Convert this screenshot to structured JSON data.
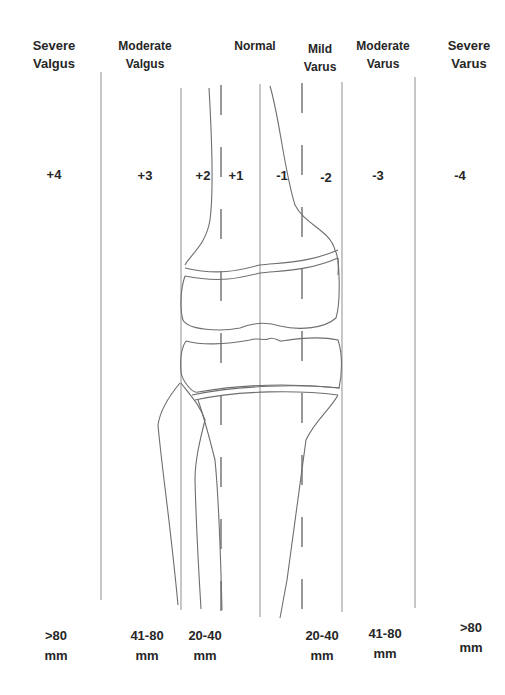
{
  "categories": [
    {
      "label": "Severe\nValgus",
      "x": 54,
      "y": 37
    },
    {
      "label": "Moderate\nValgus",
      "x": 145,
      "y": 37
    },
    {
      "label": "Normal",
      "x": 255,
      "y": 37
    },
    {
      "label": "Mild\nVarus",
      "x": 320,
      "y": 40
    },
    {
      "label": "Moderate\nVarus",
      "x": 383,
      "y": 37
    },
    {
      "label": "Severe\nVarus",
      "x": 469,
      "y": 37
    }
  ],
  "grades": [
    {
      "label": "+4",
      "x": 54
    },
    {
      "label": "+3",
      "x": 145
    },
    {
      "label": "+2",
      "x": 203
    },
    {
      "label": "+1",
      "x": 236
    },
    {
      "label": "-1",
      "x": 282
    },
    {
      "label": "-2",
      "x": 326
    },
    {
      "label": "-3",
      "x": 378
    },
    {
      "label": "-4",
      "x": 460
    }
  ],
  "distances": [
    {
      "label": ">80\nmm",
      "x": 56,
      "y": 626
    },
    {
      "label": "41-80\nmm",
      "x": 147,
      "y": 626
    },
    {
      "label": "20-40\nmm",
      "x": 205,
      "y": 626
    },
    {
      "label": "20-40\nmm",
      "x": 322,
      "y": 626
    },
    {
      "label": "41-80\nmm",
      "x": 385,
      "y": 624
    },
    {
      "label": ">80\nmm",
      "x": 471,
      "y": 618
    }
  ],
  "colors": {
    "line": "#8a8a8a",
    "bone": "#6e6e6e",
    "text": "#262626"
  }
}
